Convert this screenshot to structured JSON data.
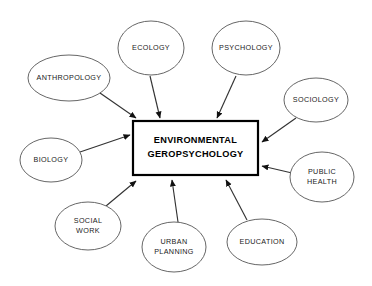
{
  "diagram": {
    "type": "hub-and-spoke concept map",
    "center": {
      "label_line1": "ENVIRONMENTAL",
      "label_line2": "GEROPSYCHOLOGY",
      "shape": "rectangle",
      "border_color": "#000000",
      "fill_color": "#ffffff",
      "x": 133,
      "y": 121,
      "width": 125,
      "height": 54
    },
    "background_color": "#ffffff",
    "node_stroke_color": "#555555",
    "connector_color": "#333333",
    "nodes": [
      {
        "id": "anthropology",
        "label": "ANTHROPOLOGY",
        "lines": [
          "ANTHROPOLOGY"
        ],
        "cx": 69,
        "cy": 78,
        "rx": 41,
        "ry": 23,
        "arrow_from_x": 100,
        "arrow_from_y": 93,
        "arrow_to_x": 136,
        "arrow_to_y": 118
      },
      {
        "id": "ecology",
        "label": "ECOLOGY",
        "lines": [
          "ECOLOGY"
        ],
        "cx": 151,
        "cy": 48,
        "rx": 33,
        "ry": 27,
        "arrow_from_x": 150,
        "arrow_from_y": 76,
        "arrow_to_x": 160,
        "arrow_to_y": 118
      },
      {
        "id": "psychology",
        "label": "PSYCHOLOGY",
        "lines": [
          "PSYCHOLOGY"
        ],
        "cx": 246,
        "cy": 48,
        "rx": 34,
        "ry": 27,
        "arrow_from_x": 236,
        "arrow_from_y": 76,
        "arrow_to_x": 217,
        "arrow_to_y": 118
      },
      {
        "id": "sociology",
        "label": "SOCIOLOGY",
        "lines": [
          "SOCIOLOGY"
        ],
        "cx": 316,
        "cy": 100,
        "rx": 32,
        "ry": 22,
        "arrow_from_x": 296,
        "arrow_from_y": 118,
        "arrow_to_x": 262,
        "arrow_to_y": 142
      },
      {
        "id": "public-health",
        "label": "PUBLIC HEALTH",
        "lines": [
          "PUBLIC",
          "HEALTH"
        ],
        "cx": 322,
        "cy": 177,
        "rx": 32,
        "ry": 25,
        "arrow_from_x": 292,
        "arrow_from_y": 173,
        "arrow_to_x": 262,
        "arrow_to_y": 166
      },
      {
        "id": "education",
        "label": "EDUCATION",
        "lines": [
          "EDUCATION"
        ],
        "cx": 262,
        "cy": 242,
        "rx": 35,
        "ry": 23,
        "arrow_from_x": 247,
        "arrow_from_y": 220,
        "arrow_to_x": 226,
        "arrow_to_y": 180
      },
      {
        "id": "urban-planning",
        "label": "URBAN PLANNING",
        "lines": [
          "URBAN",
          "PLANNING"
        ],
        "cx": 174,
        "cy": 247,
        "rx": 32,
        "ry": 25,
        "arrow_from_x": 178,
        "arrow_from_y": 222,
        "arrow_to_x": 172,
        "arrow_to_y": 180
      },
      {
        "id": "social-work",
        "label": "SOCIAL WORK",
        "lines": [
          "SOCIAL",
          "WORK"
        ],
        "cx": 88,
        "cy": 226,
        "rx": 33,
        "ry": 24,
        "arrow_from_x": 106,
        "arrow_from_y": 206,
        "arrow_to_x": 136,
        "arrow_to_y": 181
      },
      {
        "id": "biology",
        "label": "BIOLOGY",
        "lines": [
          "BIOLOGY"
        ],
        "cx": 51,
        "cy": 160,
        "rx": 31,
        "ry": 22,
        "arrow_from_x": 80,
        "arrow_from_y": 152,
        "arrow_to_x": 130,
        "arrow_to_y": 135
      }
    ]
  }
}
